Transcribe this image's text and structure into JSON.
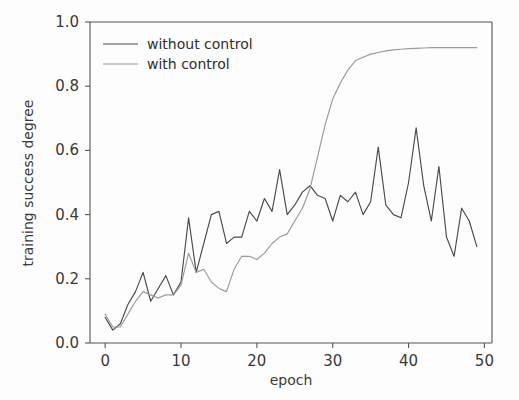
{
  "chart_data": {
    "type": "line",
    "title": "",
    "xlabel": "epoch",
    "ylabel": "training success degree",
    "xlim": [
      -2,
      51
    ],
    "ylim": [
      0.0,
      1.0
    ],
    "xticks": [
      0,
      10,
      20,
      30,
      40,
      50
    ],
    "xtick_labels": [
      "0",
      "10",
      "20",
      "30",
      "40",
      "50"
    ],
    "yticks": [
      0.0,
      0.2,
      0.4,
      0.6,
      0.8,
      1.0
    ],
    "ytick_labels": [
      "0.0",
      "0.2",
      "0.4",
      "0.6",
      "0.8",
      "1.0"
    ],
    "grid": false,
    "legend_position": "upper left",
    "x": [
      0,
      1,
      2,
      3,
      4,
      5,
      6,
      7,
      8,
      9,
      10,
      11,
      12,
      13,
      14,
      15,
      16,
      17,
      18,
      19,
      20,
      21,
      22,
      23,
      24,
      25,
      26,
      27,
      28,
      29,
      30,
      31,
      32,
      33,
      34,
      35,
      36,
      37,
      38,
      39,
      40,
      41,
      42,
      43,
      44,
      45,
      46,
      47,
      48,
      49
    ],
    "series": [
      {
        "name": "without control",
        "color": "#4a4a4a",
        "values": [
          0.08,
          0.04,
          0.06,
          0.12,
          0.16,
          0.22,
          0.13,
          0.17,
          0.21,
          0.15,
          0.19,
          0.39,
          0.22,
          0.31,
          0.4,
          0.41,
          0.31,
          0.33,
          0.33,
          0.41,
          0.38,
          0.45,
          0.41,
          0.54,
          0.4,
          0.43,
          0.47,
          0.49,
          0.46,
          0.45,
          0.38,
          0.46,
          0.44,
          0.47,
          0.4,
          0.44,
          0.61,
          0.43,
          0.4,
          0.39,
          0.5,
          0.67,
          0.49,
          0.38,
          0.55,
          0.33,
          0.27,
          0.42,
          0.38,
          0.3
        ]
      },
      {
        "name": "with control",
        "color": "#9a9a9a",
        "values": [
          0.09,
          0.05,
          0.05,
          0.09,
          0.13,
          0.16,
          0.15,
          0.14,
          0.15,
          0.15,
          0.18,
          0.28,
          0.22,
          0.23,
          0.19,
          0.17,
          0.16,
          0.23,
          0.27,
          0.27,
          0.26,
          0.28,
          0.31,
          0.33,
          0.34,
          0.38,
          0.42,
          0.48,
          0.58,
          0.68,
          0.76,
          0.81,
          0.85,
          0.88,
          0.89,
          0.9,
          0.905,
          0.91,
          0.913,
          0.915,
          0.917,
          0.918,
          0.919,
          0.92,
          0.92,
          0.92,
          0.92,
          0.92,
          0.92,
          0.92
        ]
      }
    ]
  },
  "legend": {
    "entries": [
      {
        "label": "without control"
      },
      {
        "label": "with control"
      }
    ]
  }
}
